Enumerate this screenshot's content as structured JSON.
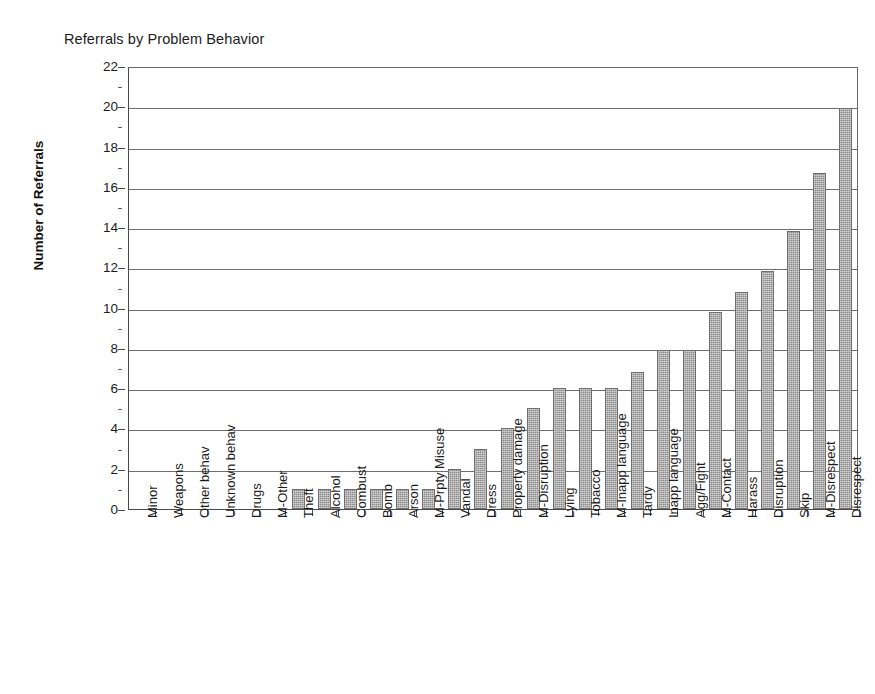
{
  "chart_data": {
    "type": "bar",
    "title": "Referrals by Problem Behavior",
    "xlabel": "",
    "ylabel": "Number of Referrals",
    "ylim": [
      0,
      22
    ],
    "ytick_step": 2,
    "yticks": [
      0,
      2,
      4,
      6,
      8,
      10,
      12,
      14,
      16,
      18,
      20,
      22
    ],
    "ytick_labels": [
      "0",
      "2",
      "4",
      "6",
      "8",
      "10",
      "12",
      "14",
      "16",
      "18",
      "20",
      "22"
    ],
    "minor_ticks": true,
    "grid": "horizontal",
    "legend": "none",
    "bar_color": "#8c8c8c",
    "categories": [
      "Minor",
      "Weapons",
      "Other behav",
      "Unknown behav",
      "Drugs",
      "M-Other",
      "Theft",
      "Alcohol",
      "Combust",
      "Bomb",
      "Arson",
      "M-Prpty Misuse",
      "Vandal",
      "Dress",
      "Property damage",
      "M-Disruption",
      "Lying",
      "Tobacco",
      "M-Inapp language",
      "Tardy",
      "Inapp language",
      "Agg/Fight",
      "M-Contact",
      "Harass",
      "Disruption",
      "Skip",
      "M-Disrespect",
      "Disrespect"
    ],
    "values": [
      0,
      0,
      0,
      0,
      0,
      0,
      1,
      1,
      1,
      1,
      1,
      1,
      2,
      3,
      4,
      5,
      6,
      6,
      6,
      6.8,
      7.9,
      7.9,
      9.8,
      10.8,
      11.8,
      13.8,
      16.7,
      19.9
    ]
  }
}
